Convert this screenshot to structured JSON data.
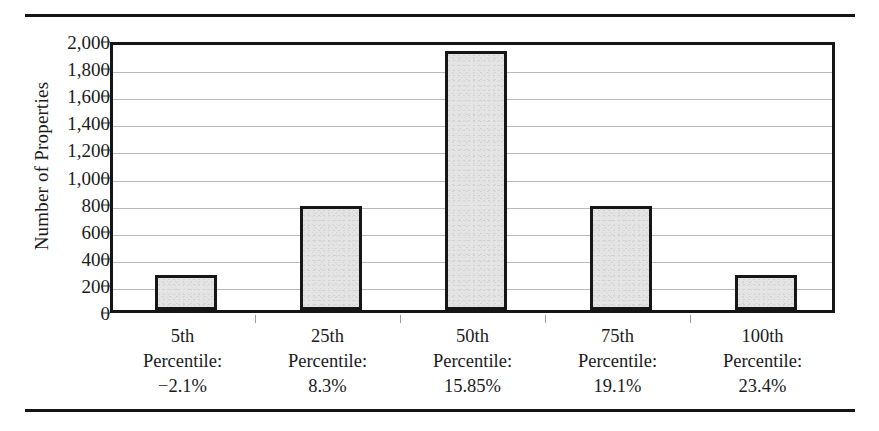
{
  "chart_data": {
    "type": "bar",
    "title": "",
    "xlabel": "",
    "ylabel": "Number of Properties",
    "ylim": [
      0,
      2000
    ],
    "ytick_values": [
      2000,
      1800,
      1600,
      1400,
      1200,
      1000,
      800,
      600,
      400,
      200,
      0
    ],
    "ytick_labels": [
      "2,000",
      "1,800",
      "1,600",
      "1,400",
      "1,200",
      "1,000",
      "800",
      "600",
      "400",
      "200",
      "0"
    ],
    "grid": true,
    "legend": "none",
    "categories": [
      "5th Percentile: −2.1%",
      "25th Percentile: 8.3%",
      "50th Percentile: 15.85%",
      "75th Percentile: 19.1%",
      "100th Percentile: 23.4%"
    ],
    "category_lines": [
      [
        "5th",
        "Percentile:",
        "−2.1%"
      ],
      [
        "25th",
        "Percentile:",
        "8.3%"
      ],
      [
        "50th",
        "Percentile:",
        "15.85%"
      ],
      [
        "75th",
        "Percentile:",
        "19.1%"
      ],
      [
        "100th",
        "Percentile:",
        "23.4%"
      ]
    ],
    "values": [
      260,
      770,
      1910,
      770,
      260
    ],
    "bar_fill_color": "#e4e4e4",
    "bar_edge_color": "#161616",
    "gridline_color": "#b9b9b9",
    "axis_color": "#151515"
  }
}
